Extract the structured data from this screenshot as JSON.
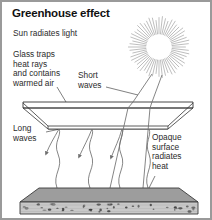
{
  "figure": {
    "title": "Greenhouse effect",
    "border_color": "#9a9a9a",
    "background_color": "#ffffff",
    "ink_color": "#2b2b2b",
    "width": 212,
    "height": 220
  },
  "labels": {
    "sun": "Sun radiates light",
    "glass": "Glass traps\nheat rays\nand contains\nwarmed air",
    "short_waves": "Short\nwaves",
    "long_waves": "Long\nwaves",
    "opaque_surface": "Opaque\nsurface\nradiates\nheat"
  },
  "elements": {
    "sun": {
      "name": "sun",
      "center_x": 157,
      "center_y": 45,
      "core_radius": 12,
      "ray_count": 56,
      "ray_outer_radius": 31,
      "core_fill": "#ffffff",
      "ray_color": "#7d7d7d"
    },
    "glass_panel": {
      "name": "glass-panel",
      "top_face_fill": "#ffffff",
      "edge_color": "#333333",
      "top_y": 100,
      "thickness": 6,
      "front_y": 127
    },
    "ground_slab": {
      "name": "ground-slab",
      "top_face_fill": "#9d9d9d",
      "front_face_fill": "#c9c9c9",
      "edge_color": "#3a3a3a",
      "top_y": 186,
      "front_y": 200,
      "bottom_y": 213,
      "speckle_color": "#3c3c3c",
      "speckle_count": 46
    },
    "short_wave_rays": {
      "name": "short-wave-rays",
      "count": 2,
      "color": "#6f6f6f",
      "style": "straight"
    },
    "long_wave_rays": {
      "name": "long-wave-rays",
      "count": 4,
      "color": "#6f6f6f",
      "style": "wavy"
    },
    "reflected_rays": {
      "name": "reflected-rays",
      "count": 3,
      "color": "#6f6f6f",
      "style": "wavy-with-arrowhead"
    }
  }
}
